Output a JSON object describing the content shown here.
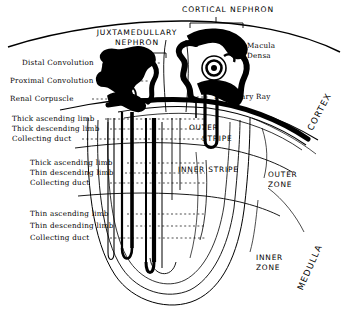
{
  "figure": {
    "type": "anatomical-diagram"
  },
  "headers": {
    "cortical_nephron": "CORTICAL  NEPHRON",
    "juxtamedullary_nephron_line1": "JUXTAMEDULLARY",
    "juxtamedullary_nephron_line2": "NEPHRON"
  },
  "left_labels": {
    "cortex_group": [
      "Distal Convolution",
      "Proximal Convolution",
      "Renal Corpuscle"
    ],
    "outer_stripe_group": [
      "Thick ascending limb",
      "Thick descending limb",
      "Collecting duct"
    ],
    "inner_stripe_group": [
      "Thick ascending limb",
      "Thin descending limb",
      "Collecting duct"
    ],
    "inner_zone_group": [
      "Thin ascending limb",
      "Thin descending limb",
      "Collecting duct"
    ]
  },
  "right_labels": {
    "macula_densa_line1": "Macula",
    "macula_densa_line2": "Densa",
    "medullary_ray": "Medullary Ray"
  },
  "region_labels": {
    "outer_stripe_line1": "OUTER",
    "outer_stripe_line2": "STRIPE",
    "inner_stripe": "INNER  STRIPE",
    "outer_zone_line1": "OUTER",
    "outer_zone_line2": "ZONE",
    "inner_zone_line1": "INNER",
    "inner_zone_line2": "ZONE",
    "cortex": "CORTEX",
    "medulla": "MEDULLA"
  },
  "colors": {
    "ink": "#000000",
    "paper": "#ffffff",
    "leader": "#111111"
  }
}
